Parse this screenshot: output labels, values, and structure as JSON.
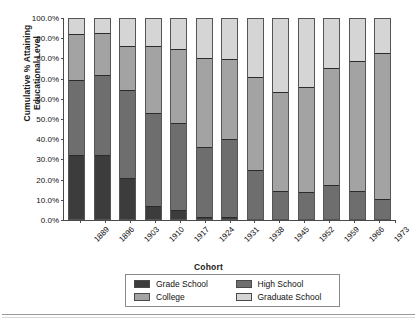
{
  "chart_data": {
    "type": "bar",
    "title": "",
    "subtitle": "",
    "xlabel": "Cohort",
    "ylabel": "Cumulative % Attaining Educational Level",
    "ylabel_line1": "Cumulative % Attaining",
    "ylabel_line2": "Educational Level",
    "stacked": true,
    "stack_mode": "cumulative-100%",
    "grid": false,
    "legend_position": "bottom",
    "ylim": [
      0,
      100
    ],
    "ytick_labels": [
      "0.0%",
      "10.0%",
      "20.0%",
      "30.0%",
      "40.0%",
      "50.0%",
      "60.0%",
      "70.0%",
      "80.0%",
      "90.0%",
      "100.0%"
    ],
    "ytick_values": [
      0,
      10,
      20,
      30,
      40,
      50,
      60,
      70,
      80,
      90,
      100
    ],
    "categories": [
      "1889",
      "1896",
      "1903",
      "1910",
      "1917",
      "1924",
      "1931",
      "1938",
      "1945",
      "1952",
      "1959",
      "1966",
      "1973"
    ],
    "series": [
      {
        "name": "Grade School",
        "color": "#3c3c3c",
        "values": [
          32.2,
          32.3,
          20.8,
          7.0,
          4.8,
          1.3,
          1.3,
          0.0,
          0.0,
          0.0,
          0.0,
          0.0,
          0.0
        ]
      },
      {
        "name": "High School",
        "color": "#6e6e6e",
        "values": [
          37.2,
          39.6,
          43.5,
          46.0,
          43.2,
          34.8,
          38.6,
          24.8,
          14.2,
          13.7,
          17.2,
          14.2,
          10.5
        ]
      },
      {
        "name": "College",
        "color": "#a3a3a3",
        "values": [
          22.7,
          20.9,
          22.0,
          33.0,
          36.8,
          43.9,
          40.0,
          45.8,
          49.3,
          52.0,
          57.9,
          64.7,
          72.0
        ]
      },
      {
        "name": "Graduate School",
        "color": "#d5d5d5",
        "values": [
          7.9,
          7.2,
          13.7,
          14.0,
          15.2,
          20.0,
          20.1,
          29.4,
          36.5,
          34.3,
          24.9,
          21.1,
          17.5
        ]
      }
    ],
    "cumulative_tops": {
      "Grade School": [
        32.2,
        32.3,
        20.8,
        7.0,
        4.8,
        1.3,
        1.3,
        0.0,
        0.0,
        0.0,
        0.0,
        0.0,
        0.0
      ],
      "High School": [
        69.4,
        71.9,
        64.3,
        53.0,
        48.0,
        36.1,
        39.9,
        24.8,
        14.2,
        13.7,
        17.2,
        14.2,
        10.5
      ],
      "College": [
        92.1,
        92.8,
        86.3,
        86.0,
        84.8,
        80.0,
        79.9,
        70.6,
        63.5,
        65.7,
        75.1,
        78.9,
        82.5
      ],
      "Graduate School": [
        100,
        100,
        100,
        100,
        100,
        100,
        100,
        100,
        100,
        100,
        100,
        100,
        100
      ]
    }
  },
  "legend": {
    "items": [
      {
        "label": "Grade School",
        "color": "#3c3c3c"
      },
      {
        "label": "High School",
        "color": "#6e6e6e"
      },
      {
        "label": "College",
        "color": "#a3a3a3"
      },
      {
        "label": "Graduate School",
        "color": "#d5d5d5"
      }
    ]
  }
}
